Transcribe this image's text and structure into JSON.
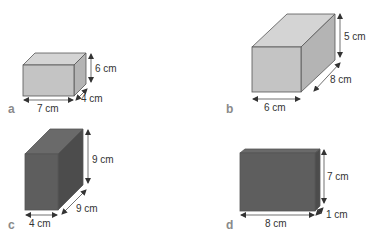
{
  "colors": {
    "light_front": "#c4c4c4",
    "light_top": "#d4d4d4",
    "light_side": "#b4b4b4",
    "dark_front": "#5e5e5e",
    "dark_top": "#6a6a6a",
    "dark_side": "#4c4c4c",
    "label_text": "#333333",
    "tag_text": "#8a8a8a"
  },
  "shapes": [
    {
      "tag": "a",
      "length": "7 cm",
      "width": "4 cm",
      "height": "6 cm"
    },
    {
      "tag": "b",
      "length": "6 cm",
      "width": "8 cm",
      "height": "5 cm"
    },
    {
      "tag": "c",
      "length": "4 cm",
      "width": "9 cm",
      "height": "9 cm"
    },
    {
      "tag": "d",
      "length": "8 cm",
      "width": "1 cm",
      "height": "7 cm"
    }
  ]
}
